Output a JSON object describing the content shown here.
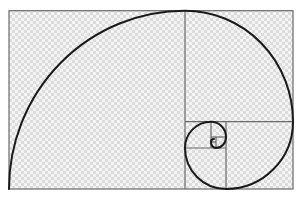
{
  "diagram": {
    "title": "Golden ratio rectangle with Fibonacci spiral",
    "colors": {
      "background": "#ffffff",
      "checker_light": "#f4f4f4",
      "checker_dark": "#dcdcdc",
      "grid_line": "#6a6a6a",
      "spiral": "#1a1a1a"
    },
    "outer_rectangle": {
      "x": 9,
      "y": 10.7,
      "width": 284,
      "height": 178.3
    },
    "squares": [
      {
        "name": "square-1",
        "x": 9,
        "y": 10.7,
        "size": 176
      },
      {
        "name": "square-2",
        "x": 185,
        "y": 10.7,
        "size": 108
      },
      {
        "name": "square-3",
        "x": 226,
        "y": 121.7,
        "size": 67
      },
      {
        "name": "square-4",
        "x": 185,
        "y": 148,
        "size": 41
      },
      {
        "name": "square-5",
        "x": 185,
        "y": 121.7,
        "size": 26
      },
      {
        "name": "square-6",
        "x": 211,
        "y": 121.7,
        "size": 15
      },
      {
        "name": "square-7",
        "x": 216,
        "y": 137,
        "size": 10
      },
      {
        "name": "square-8",
        "x": 211,
        "y": 142,
        "size": 5
      }
    ],
    "spiral_label": "Fibonacci spiral"
  }
}
